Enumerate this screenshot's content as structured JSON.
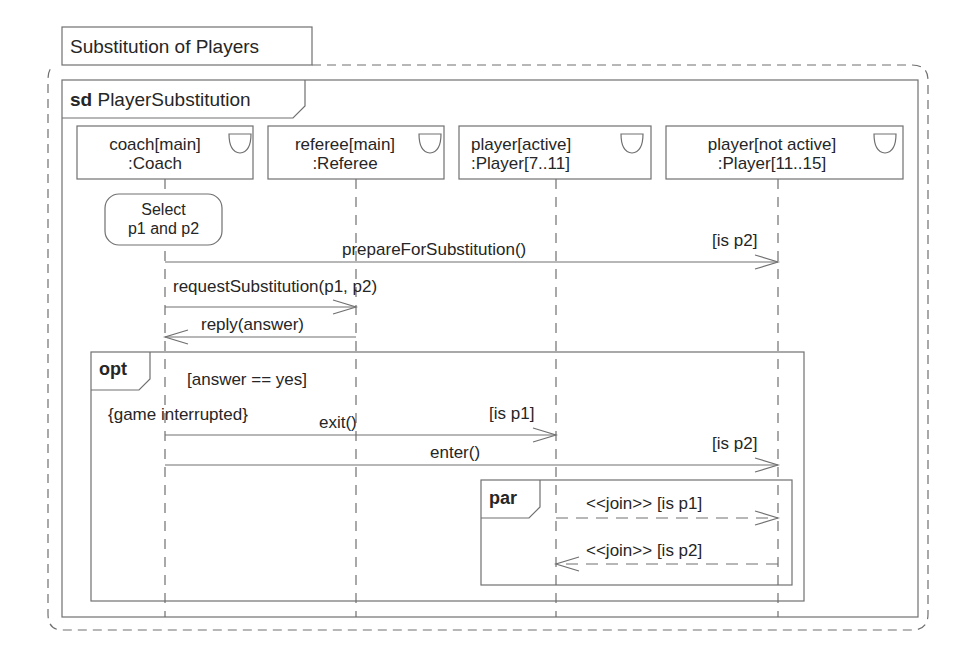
{
  "diagram": {
    "title": "Substitution of Players",
    "frame": {
      "keyword": "sd",
      "name": "PlayerSubstitution"
    },
    "lifelines": [
      {
        "id": "coach",
        "line1": "coach[main]",
        "line2": ":Coach",
        "icon": "control-icon"
      },
      {
        "id": "referee",
        "line1": "referee[main]",
        "line2": ":Referee",
        "icon": "control-icon"
      },
      {
        "id": "player-active",
        "line1": "player[active]",
        "line2": ":Player[7..11]",
        "icon": "control-icon"
      },
      {
        "id": "player-not-active",
        "line1": "player[not active]",
        "line2": ":Player[11..15]",
        "icon": "control-icon"
      }
    ],
    "action": {
      "line1": "Select",
      "line2": "p1 and p2"
    },
    "messages": [
      {
        "label": "prepareForSubstitution()",
        "guard": "[is p2]",
        "from": "coach",
        "to": "player-not-active"
      },
      {
        "label": "requestSubstitution(p1, p2)",
        "from": "coach",
        "to": "referee"
      },
      {
        "label": "reply(answer)",
        "from": "referee",
        "to": "coach"
      }
    ],
    "opt": {
      "operator": "opt",
      "guard": "[answer == yes]",
      "constraint": "{game interrupted}",
      "messages": [
        {
          "label": "exit()",
          "guard": "[is p1]",
          "from": "coach",
          "to": "player-active"
        },
        {
          "label": "enter()",
          "guard": "[is p2]",
          "from": "coach",
          "to": "player-not-active"
        }
      ],
      "par": {
        "operator": "par",
        "messages": [
          {
            "label": "<<join>> [is p1]",
            "from": "player-active",
            "to": "player-not-active",
            "style": "dashed"
          },
          {
            "label": "<<join>> [is p2]",
            "from": "player-not-active",
            "to": "player-active",
            "style": "dashed"
          }
        ]
      }
    }
  },
  "colors": {
    "line": "#6e6e6e",
    "text": "#262626",
    "background": "#ffffff"
  }
}
